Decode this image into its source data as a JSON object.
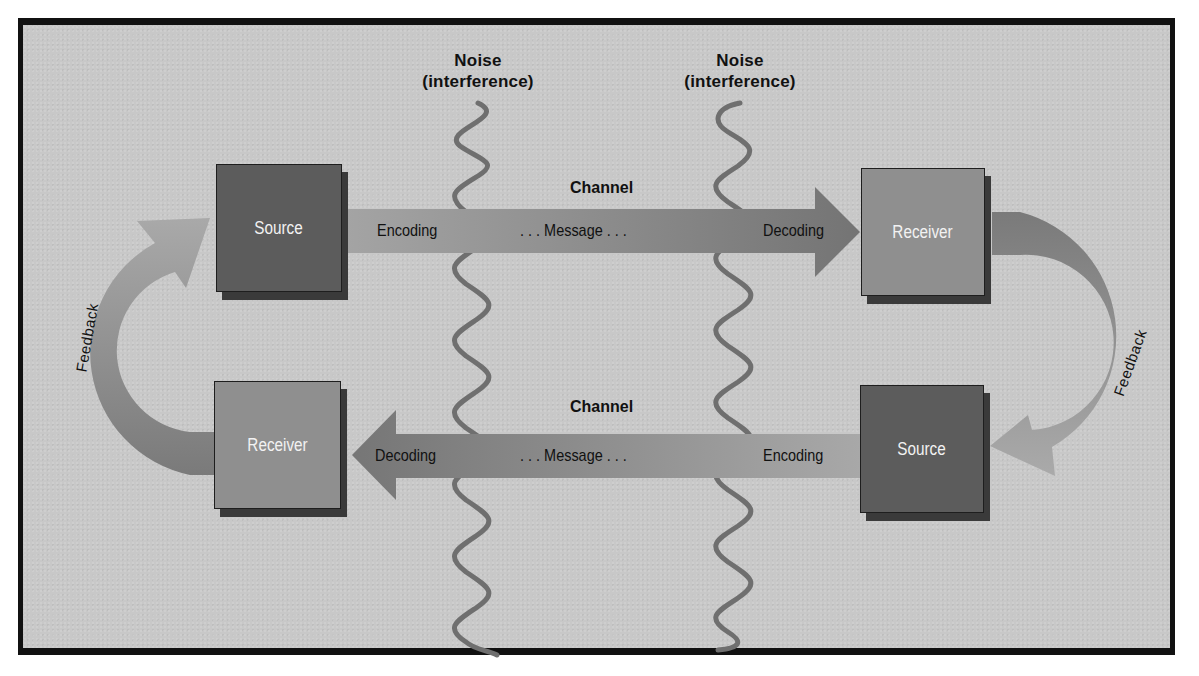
{
  "diagram": {
    "noise": [
      {
        "line1": "Noise",
        "line2": "(interference)"
      },
      {
        "line1": "Noise",
        "line2": "(interference)"
      }
    ],
    "top_path": {
      "channel_label": "Channel",
      "left_box": "Source",
      "right_box": "Receiver",
      "encoding": "Encoding",
      "message": ". . . Message . . .",
      "decoding": "Decoding",
      "direction": "left-to-right"
    },
    "bottom_path": {
      "channel_label": "Channel",
      "left_box": "Receiver",
      "right_box": "Source",
      "decoding": "Decoding",
      "message": ". . . Message . . .",
      "encoding": "Encoding",
      "direction": "right-to-left"
    },
    "feedback_left": "Feedback",
    "feedback_right": "Feedback"
  },
  "colors": {
    "background": "#c8c8c8",
    "frame_border": "#111111",
    "source_box": "#5c5c5c",
    "receiver_box": "#8f8f8f",
    "box_shadow": "#3a3a3a",
    "arrow_dark": "#7a7a7a",
    "arrow_light": "#a8a8a8",
    "noise_wave": "#6e6e6e",
    "text_dark": "#111111",
    "text_light": "#f2f2f2"
  }
}
